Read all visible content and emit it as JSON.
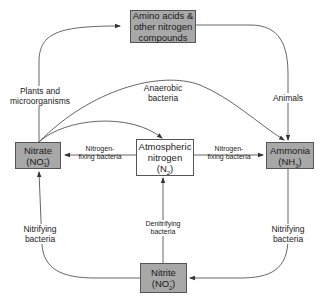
{
  "diagram": {
    "nodes": {
      "amino": {
        "line1": "Amino acids &",
        "line2": "other nitrogen",
        "line3": "compounds",
        "fill": "#a8a8a8"
      },
      "nitrate": {
        "line1": "Nitrate",
        "formula": "(NO",
        "sub": "3",
        "sup": "−",
        "close": ")",
        "fill": "#a8a8a8"
      },
      "atmospheric": {
        "line1": "Atmospheric",
        "line2": "nitrogen",
        "formula": "(N",
        "sub": "2",
        "close": ")",
        "fill": "#ffffff"
      },
      "ammonia": {
        "line1": "Ammonia",
        "formula": "(NH",
        "sub": "3",
        "close": ")",
        "fill": "#a8a8a8"
      },
      "nitrite": {
        "line1": "Nitrite",
        "formula": "(NO",
        "sub": "2",
        "sup": "−",
        "close": ")",
        "fill": "#a8a8a8"
      }
    },
    "edges": [
      {
        "from": "nitrate",
        "to": "amino",
        "label_line1": "Plants and",
        "label_line2": "microorganisms"
      },
      {
        "from": "amino",
        "to": "ammonia",
        "label_line1": "Animals"
      },
      {
        "from": "nitrate",
        "to": "ammonia",
        "label_line1": "Anaerobic",
        "label_line2": "bacteria"
      },
      {
        "from": "nitrate",
        "to": "atmospheric",
        "label_line1": ""
      },
      {
        "from": "atmospheric",
        "to": "nitrate",
        "label_line1": "Nitrogen-",
        "label_line2": "fixing bacteria"
      },
      {
        "from": "atmospheric",
        "to": "ammonia",
        "label_line1": "Nitrogen-",
        "label_line2": "fixing bacteria"
      },
      {
        "from": "nitrite",
        "to": "atmospheric",
        "label_line1": "Denitrifying",
        "label_line2": "bacteria"
      },
      {
        "from": "ammonia",
        "to": "nitrite",
        "label_line1": "Nitrifying",
        "label_line2": "bacteria"
      },
      {
        "from": "nitrite",
        "to": "nitrate",
        "label_line1": "Nitrifying",
        "label_line2": "bacteria"
      }
    ],
    "colors": {
      "line": "#444444",
      "box_border": "#555555",
      "shaded_fill": "#a8a8a8"
    }
  }
}
